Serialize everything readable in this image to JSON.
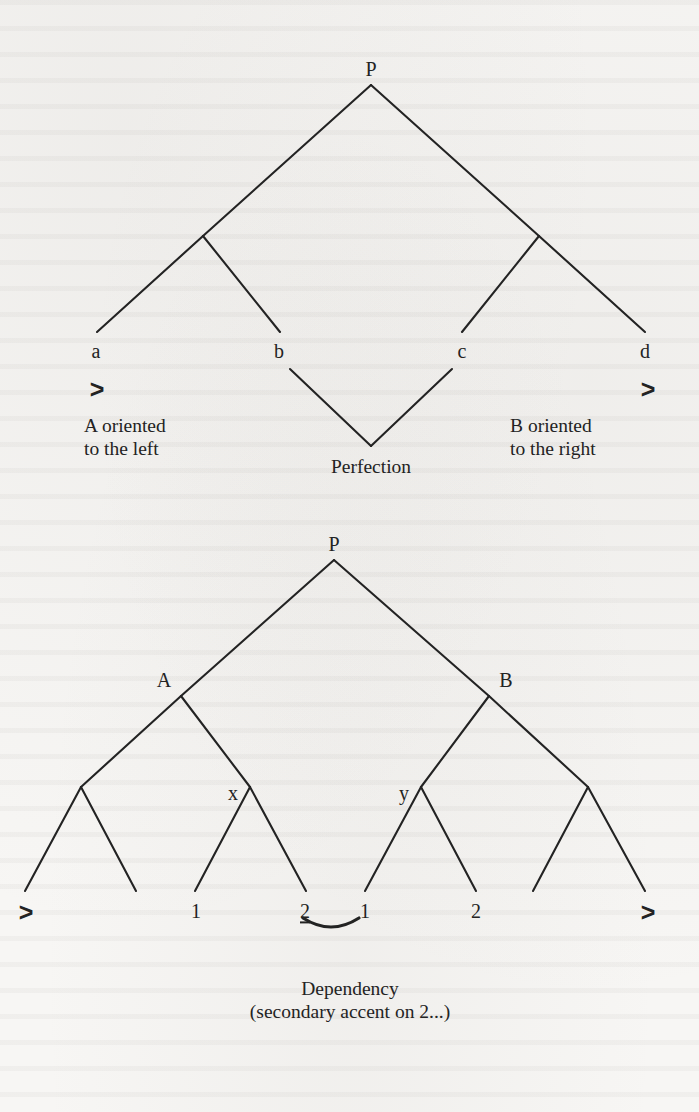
{
  "figure": {
    "kind": "metrical-tree-diagrams",
    "ink_color": "#232323",
    "page_color": "#f7f6f4"
  },
  "tree_one": {
    "root_label": "P",
    "node_labels": [
      "a",
      "b",
      "c",
      "d"
    ],
    "markers": {
      "left": ">",
      "right": ">"
    },
    "captions": {
      "left_line1": "A oriented",
      "left_line2": "to the left",
      "right_line1": "B oriented",
      "right_line2": "to the right",
      "center": "Perfection"
    }
  },
  "tree_two": {
    "root_label": "P",
    "branch_labels": {
      "left": "A",
      "right": "B"
    },
    "sub_labels": {
      "left": "x",
      "right": "y"
    },
    "leaf_labels": [
      ">",
      "1",
      "2",
      "1",
      "2",
      ">"
    ],
    "accented_leaf": "2",
    "caption_line1": "Dependency",
    "caption_line2": "(secondary accent on 2...)"
  }
}
